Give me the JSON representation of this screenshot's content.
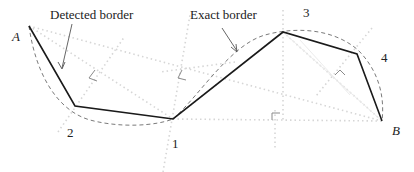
{
  "labels": {
    "detected_border": "Detected border",
    "exact_border": "Exact border",
    "point_a": "A",
    "point_b": "B",
    "vertex_1": "1",
    "vertex_2": "2",
    "vertex_3": "3",
    "vertex_4": "4"
  },
  "points": {
    "A": [
      29,
      26
    ],
    "v2": [
      75,
      106
    ],
    "v1": [
      173,
      119
    ],
    "v3": [
      283,
      32
    ],
    "v4": [
      357,
      54
    ],
    "B": [
      382,
      121
    ]
  },
  "colors": {
    "detected": "#1a1a1a",
    "exact": "#777777",
    "construction": "#dcdcdc",
    "right_angle": "#8a8a8a"
  }
}
